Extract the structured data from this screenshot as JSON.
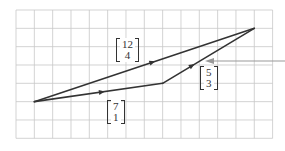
{
  "diagram": {
    "type": "vector-addition-grid",
    "grid": {
      "origin_px": [
        16,
        10
      ],
      "cell_px": 18.33,
      "cols": 14,
      "rows": 7,
      "line_color": "#c8c8c8",
      "border_color": "#bdbdbd"
    },
    "points": {
      "start": {
        "grid": [
          1,
          5
        ]
      },
      "mid": {
        "grid": [
          8,
          4
        ]
      },
      "end": {
        "grid": [
          13,
          1
        ]
      }
    },
    "vectors": [
      {
        "id": "resultant",
        "from": "start",
        "to": "end",
        "label_top": "12",
        "label_bottom": "4",
        "color": "#333333"
      },
      {
        "id": "first",
        "from": "start",
        "to": "mid",
        "label_top": "7",
        "label_bottom": "1",
        "color": "#333333"
      },
      {
        "id": "second",
        "from": "mid",
        "to": "end",
        "label_top": "5",
        "label_bottom": "3",
        "color": "#333333"
      }
    ],
    "pointer": {
      "color": "#999999",
      "from_px": [
        285,
        61
      ],
      "to_px": [
        205,
        61
      ]
    }
  },
  "labels": {
    "resultant": {
      "top": "12",
      "bottom": "4"
    },
    "first": {
      "top": "7",
      "bottom": "1"
    },
    "second": {
      "top": "5",
      "bottom": "3"
    }
  }
}
